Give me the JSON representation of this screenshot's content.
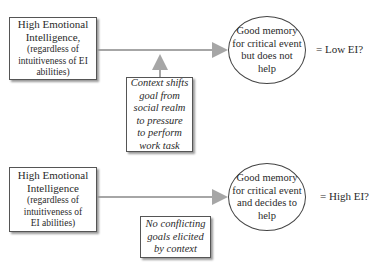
{
  "diagram": {
    "top_row": {
      "source_box": {
        "title_lines": [
          "High Emotional",
          "Intelligence,"
        ],
        "sub_lines": [
          "(regardless of",
          "intuitiveness of EI",
          "abilities)"
        ]
      },
      "context_box": {
        "lines": [
          "Context shifts",
          "goal from",
          "social realm",
          "to pressure",
          "to perform",
          "work task"
        ]
      },
      "outcome_ellipse": {
        "lines": [
          "Good memory",
          "for critical event",
          "but does not",
          "help"
        ]
      },
      "result_label": "= Low EI?"
    },
    "bottom_row": {
      "source_box": {
        "title_lines": [
          "High Emotional",
          "Intelligence"
        ],
        "sub_lines": [
          "(regardless of",
          "intuitiveness of",
          "EI abilities)"
        ]
      },
      "context_box": {
        "lines": [
          "No conflicting",
          "goals elicited",
          "by context"
        ]
      },
      "outcome_ellipse": {
        "lines": [
          "Good memory",
          "for critical event",
          "and decides to",
          "help"
        ]
      },
      "result_label": "= High EI?"
    },
    "colors": {
      "arrow": "#a6a6a6",
      "border": "#555555",
      "text": "#2a2a2a"
    }
  }
}
